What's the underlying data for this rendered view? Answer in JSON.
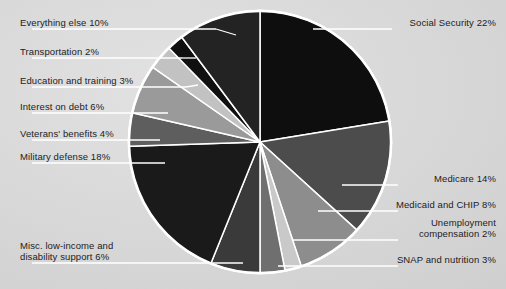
{
  "chart_data": {
    "type": "pie",
    "title": "",
    "subtitle": "",
    "xlabel": "",
    "ylabel": "",
    "legend_position": "callout-labels",
    "grid": false,
    "units": "percent of federal budget",
    "start_angle_deg": 0,
    "direction": "clockwise",
    "categories": [
      "Social Security",
      "Medicare",
      "Medicaid and CHIP",
      "Unemployment compensation",
      "SNAP and nutrition",
      "Misc. low-income and disability support",
      "Military defense",
      "Veterans' benefits",
      "Interest on debt",
      "Education and training",
      "Transportation",
      "Everything else"
    ],
    "values": [
      22,
      14,
      8,
      2,
      3,
      6,
      18,
      4,
      6,
      3,
      2,
      10
    ],
    "labels": [
      "Social Security 22%",
      "Medicare 14%",
      "Medicaid and CHIP 8%",
      "Unemployment\ncompensation 2%",
      "SNAP and nutrition 3%",
      "Misc. low-income and\ndisability support 6%",
      "Military defense 18%",
      "Veterans' benefits 4%",
      "Interest on debt 6%",
      "Education and training 3%",
      "Transportation 2%",
      "Everything else 10%"
    ],
    "colors": [
      "#0e0e0e",
      "#4c4c4c",
      "#8d8d8d",
      "#c9c9c9",
      "#6f6f6f",
      "#3a3a3a",
      "#1a1a1a",
      "#5e5e5e",
      "#9a9a9a",
      "#c2c2c2",
      "#101010",
      "#232323"
    ]
  },
  "style": {
    "background_color": "#d9d9d9",
    "slice_border_color": "#ffffff",
    "leader_line_color": "#ffffff",
    "label_text_color": "#1c1c1c"
  },
  "labels_right": [
    {
      "text": "Social Security 22%"
    },
    {
      "text": "Medicare 14%"
    },
    {
      "text": "Medicaid and CHIP 8%"
    },
    {
      "text": "Unemployment"
    },
    {
      "text": "compensation 2%"
    },
    {
      "text": "SNAP and nutrition 3%"
    }
  ],
  "labels_left": [
    {
      "text": "Everything else 10%"
    },
    {
      "text": "Transportation 2%"
    },
    {
      "text": "Education and training 3%"
    },
    {
      "text": "Interest on debt 6%"
    },
    {
      "text": "Veterans' benefits 4%"
    },
    {
      "text": "Military defense 18%"
    },
    {
      "text": "Misc. low-income and"
    },
    {
      "text": "disability support 6%"
    }
  ]
}
